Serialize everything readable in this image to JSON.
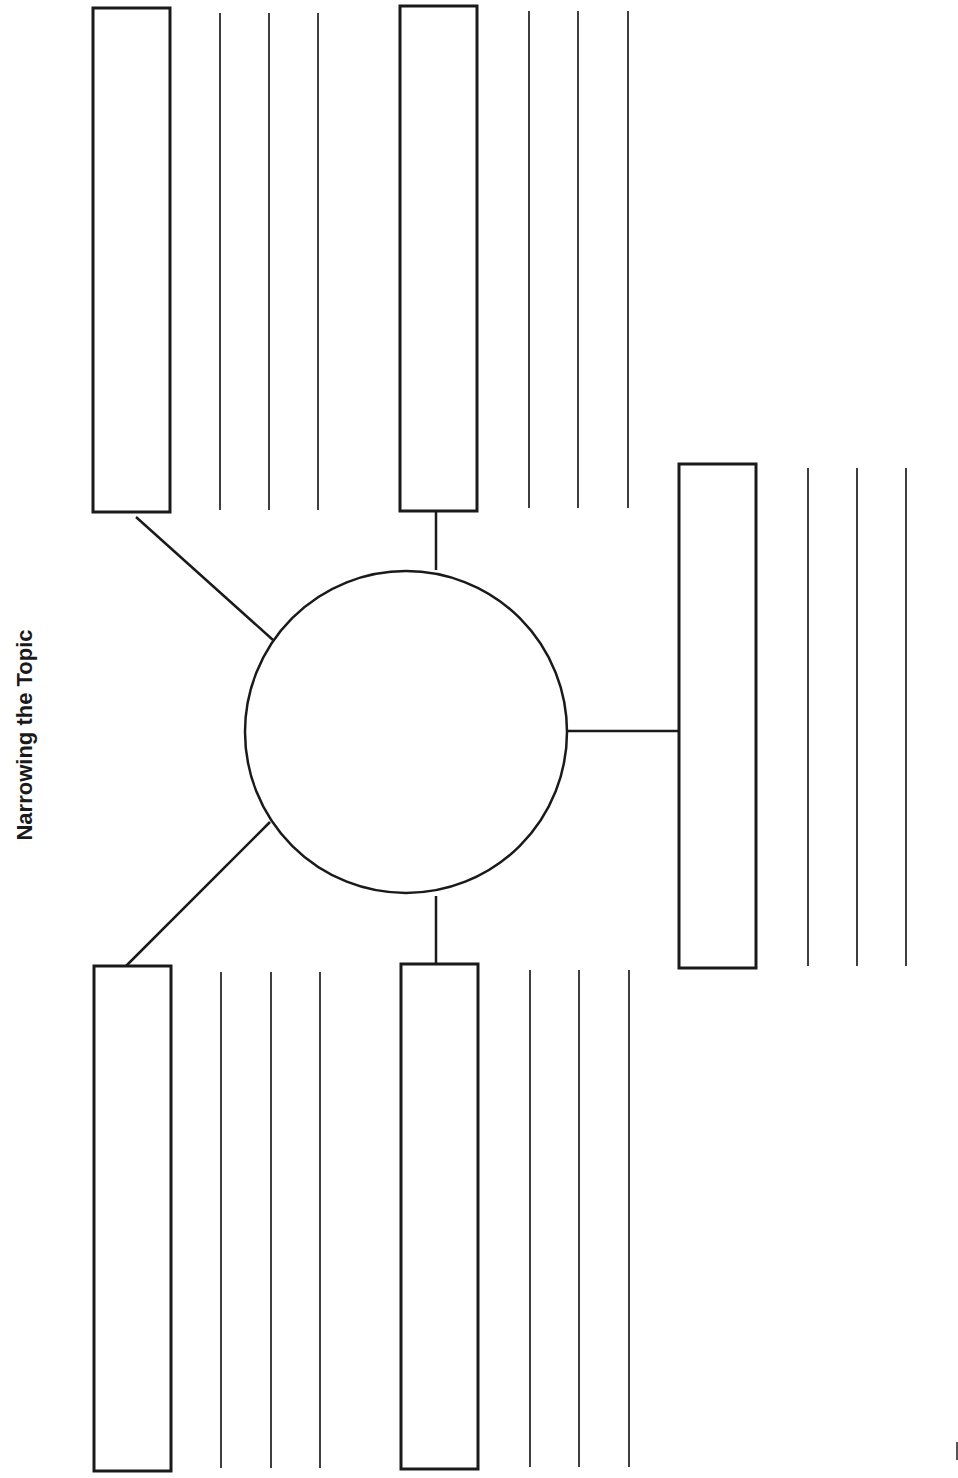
{
  "title": "Narrowing the Topic",
  "orientation": "rotated 90° counter-clockwise (landscape worksheet)",
  "central_topic": {
    "label": "",
    "shape": "circle"
  },
  "subtopics": [
    {
      "id": "subtopic-1",
      "label": "",
      "writing_lines": 3
    },
    {
      "id": "subtopic-2",
      "label": "",
      "writing_lines": 3
    },
    {
      "id": "subtopic-3",
      "label": "",
      "writing_lines": 3
    },
    {
      "id": "subtopic-4",
      "label": "",
      "writing_lines": 3
    },
    {
      "id": "subtopic-5",
      "label": "",
      "writing_lines": 3
    }
  ],
  "colors": {
    "ink": "#1a1a1a",
    "background": "#ffffff"
  }
}
